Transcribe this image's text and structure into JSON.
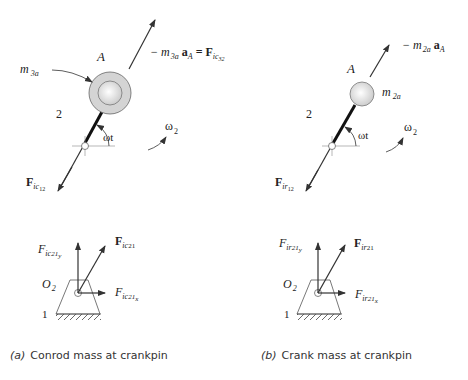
{
  "panels": [
    {
      "id": "a",
      "caption_letter": "(a)",
      "caption_text": "Conrod mass at crankpin",
      "point_label": "A",
      "link_label": "2",
      "mass_label": "m",
      "mass_sub": "3a",
      "accel_eq_prefix": "− m",
      "accel_eq_sub": "3a",
      "accel_eq_a": "a",
      "accel_eq_asub": "A",
      "accel_eq_eq": " = F",
      "accel_eq_fsub": "ic",
      "accel_eq_fsub2": "32",
      "angle_label": "ωt",
      "omega_label": "ω",
      "omega_sub": "2",
      "shaft_force": "F",
      "shaft_force_sub": "ic",
      "shaft_force_sub2": "12",
      "ground_label": "O",
      "ground_sub": "2",
      "frame_label": "1",
      "fy_label": "F",
      "fy_sub": "ic",
      "fy_sub2": "21",
      "fy_sub3": "y",
      "f_label": "F",
      "f_sub": "ic",
      "f_sub2": "21",
      "fx_label": "F",
      "fx_sub": "ic",
      "fx_sub2": "21",
      "fx_sub3": "x"
    },
    {
      "id": "b",
      "caption_letter": "(b)",
      "caption_text": "Crank mass at crankpin",
      "point_label": "A",
      "link_label": "2",
      "mass_label": "m",
      "mass_sub": "2a",
      "accel_eq_prefix": "− m",
      "accel_eq_sub": "2a",
      "accel_eq_a": "a",
      "accel_eq_asub": "A",
      "angle_label": "ωt",
      "omega_label": "ω",
      "omega_sub": "2",
      "shaft_force": "F",
      "shaft_force_sub": "ir",
      "shaft_force_sub2": "12",
      "ground_label": "O",
      "ground_sub": "2",
      "frame_label": "1",
      "fy_label": "F",
      "fy_sub": "ir",
      "fy_sub2": "21",
      "fy_sub3": "y",
      "f_label": "F",
      "f_sub": "ir",
      "f_sub2": "21",
      "fx_label": "F",
      "fx_sub": "ir",
      "fx_sub2": "21",
      "fx_sub3": "x"
    }
  ],
  "colors": {
    "line": "#333333",
    "mass_fill": "#d8d8d8",
    "mass_inner": "#f4f4f4"
  }
}
